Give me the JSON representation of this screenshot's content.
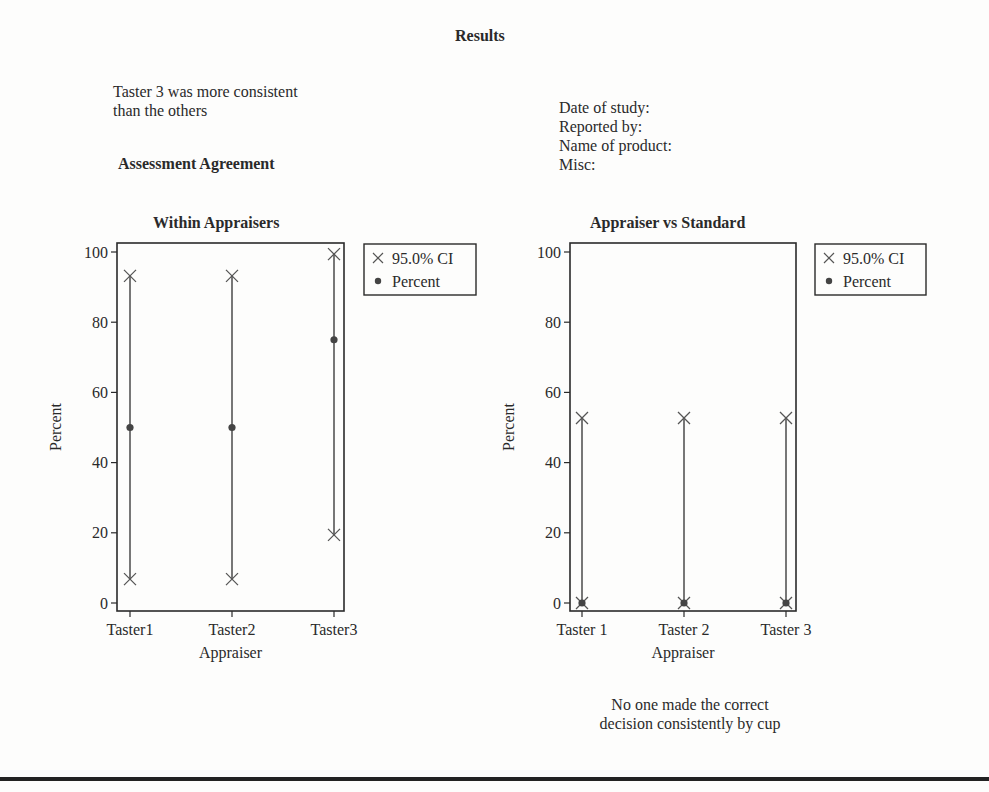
{
  "page": {
    "title": "Results",
    "left_note": [
      "Taster 3 was more consistent",
      "than the others"
    ],
    "section_heading": "Assessment Agreement",
    "info_fields": [
      "Date of study:",
      "Reported by:",
      "Name of product:",
      "Misc:"
    ],
    "bottom_note": [
      "No one made the correct",
      "decision consistently by cup"
    ]
  },
  "colors": {
    "ink": "#2a2a2a",
    "line": "#555555",
    "background": "#fdfdfc"
  },
  "chart_data": [
    {
      "type": "scatter",
      "title": "Within Appraisers",
      "xlabel": "Appraiser",
      "ylabel": "Percent",
      "categories": [
        "Taster1",
        "Taster2",
        "Taster3"
      ],
      "ylim": [
        0,
        100
      ],
      "yticks": [
        0,
        20,
        40,
        60,
        80,
        100
      ],
      "grid": false,
      "legend": {
        "position": "right-top",
        "entries": [
          "95.0% CI",
          "Percent"
        ]
      },
      "series": [
        {
          "name": "Percent",
          "marker": "dot",
          "values": [
            50,
            50,
            75
          ]
        },
        {
          "name": "95.0% CI lower",
          "marker": "x",
          "values": [
            6.8,
            6.8,
            19.4
          ]
        },
        {
          "name": "95.0% CI upper",
          "marker": "x",
          "values": [
            93.2,
            93.2,
            99.4
          ]
        }
      ]
    },
    {
      "type": "scatter",
      "title": "Appraiser vs Standard",
      "xlabel": "Appraiser",
      "ylabel": "Percent",
      "categories": [
        "Taster 1",
        "Taster 2",
        "Taster 3"
      ],
      "ylim": [
        0,
        100
      ],
      "yticks": [
        0,
        20,
        40,
        60,
        80,
        100
      ],
      "grid": false,
      "legend": {
        "position": "right-top",
        "entries": [
          "95.0% CI",
          "Percent"
        ]
      },
      "series": [
        {
          "name": "Percent",
          "marker": "dot",
          "values": [
            0,
            0,
            0
          ]
        },
        {
          "name": "95.0% CI lower",
          "marker": "x",
          "values": [
            0,
            0,
            0
          ]
        },
        {
          "name": "95.0% CI upper",
          "marker": "x",
          "values": [
            52.7,
            52.7,
            52.7
          ]
        }
      ]
    }
  ]
}
